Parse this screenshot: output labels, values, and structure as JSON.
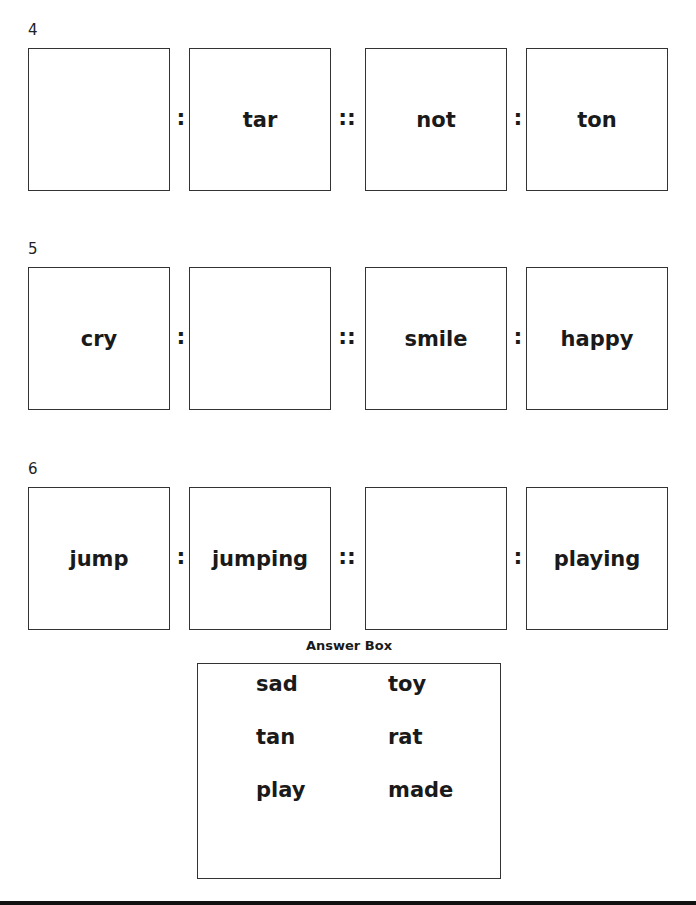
{
  "questions": [
    {
      "number": "4",
      "cells": [
        "",
        "tar",
        "not",
        "ton"
      ],
      "separators": [
        ":",
        "::",
        ":"
      ]
    },
    {
      "number": "5",
      "cells": [
        "cry",
        "",
        "smile",
        "happy"
      ],
      "separators": [
        ":",
        "::",
        ":"
      ]
    },
    {
      "number": "6",
      "cells": [
        "jump",
        "jumping",
        "",
        "playing"
      ],
      "separators": [
        ":",
        "::",
        ":"
      ]
    }
  ],
  "answer_box": {
    "title": "Answer Box",
    "words": [
      "sad",
      "toy",
      "tan",
      "rat",
      "play",
      "made"
    ]
  }
}
